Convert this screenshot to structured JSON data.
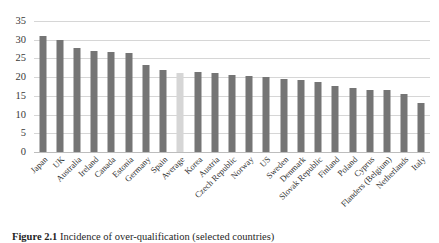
{
  "caption": {
    "label": "Figure 2.1",
    "text": "Incidence of over-qualification (selected countries)"
  },
  "chart_data": {
    "type": "bar",
    "title": "",
    "xlabel": "",
    "ylabel": "",
    "ylim": [
      0,
      35
    ],
    "ytick_step": 5,
    "yticks": [
      "35",
      "30",
      "25",
      "20",
      "15",
      "10",
      "5",
      "0"
    ],
    "grid": true,
    "legend": "none",
    "bar_color": "#757575",
    "highlight_color": "#d6d6d6",
    "highlight_category": "Average",
    "categories": [
      "Japan",
      "UK",
      "Australia",
      "Ireland",
      "Canada",
      "Estonia",
      "Germany",
      "Spain",
      "Average",
      "Korea",
      "Austria",
      "Czech Republic",
      "Norway",
      "US",
      "Sweden",
      "Denmark",
      "Slovak Republic",
      "Finland",
      "Poland",
      "Cyprus",
      "Flanders (Belgium)",
      "Netherlands",
      "Italy"
    ],
    "values": [
      31.0,
      29.8,
      27.7,
      27.1,
      26.8,
      26.5,
      23.2,
      21.8,
      21.2,
      21.3,
      21.1,
      20.6,
      20.4,
      20.1,
      19.5,
      19.3,
      18.8,
      17.7,
      17.0,
      16.7,
      16.6,
      15.4,
      13.2
    ]
  }
}
